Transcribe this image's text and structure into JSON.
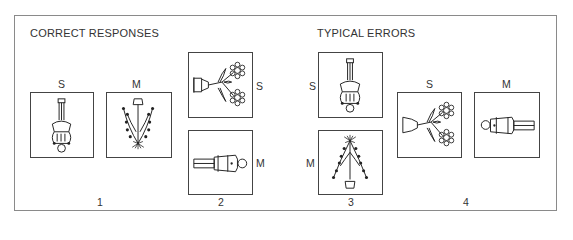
{
  "headings": {
    "correct": "CORRECT RESPONSES",
    "errors": "TYPICAL ERRORS"
  },
  "groups": [
    {
      "number": "1",
      "section": "correct",
      "items": [
        {
          "label": "S",
          "figure": "person-inverted-icon",
          "orientation": "upside-down"
        },
        {
          "label": "M",
          "figure": "christmas-tree-icon",
          "orientation": "upside-down"
        }
      ]
    },
    {
      "number": "2",
      "section": "correct",
      "items": [
        {
          "label": "S",
          "figure": "flowerpot-icon",
          "orientation": "rotated-right"
        },
        {
          "label": "M",
          "figure": "person-icon",
          "orientation": "rotated-left"
        }
      ]
    },
    {
      "number": "3",
      "section": "errors",
      "items": [
        {
          "label": "S",
          "figure": "person-inverted-icon",
          "orientation": "upside-down"
        },
        {
          "label": "M",
          "figure": "christmas-tree-icon",
          "orientation": "upright"
        }
      ]
    },
    {
      "number": "4",
      "section": "errors",
      "items": [
        {
          "label": "S",
          "figure": "flowerpot-icon",
          "orientation": "rotated-right"
        },
        {
          "label": "M",
          "figure": "person-icon",
          "orientation": "rotated-right"
        }
      ]
    }
  ]
}
